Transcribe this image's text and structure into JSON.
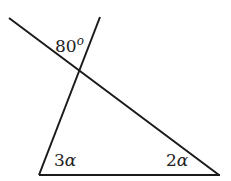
{
  "diagram": {
    "type": "geometry-triangle",
    "labels": {
      "exterior_angle": "80",
      "exterior_angle_unit": "o",
      "left_angle_coef": "3",
      "left_angle_var": "α",
      "right_angle_coef": "2",
      "right_angle_var": "α"
    },
    "lines": [
      {
        "name": "transversal",
        "x1": 9,
        "y1": 18,
        "x2": 219,
        "y2": 175
      },
      {
        "name": "left-side",
        "x1": 100,
        "y1": 17,
        "x2": 39,
        "y2": 175
      },
      {
        "name": "base",
        "x1": 39,
        "y1": 175,
        "x2": 219,
        "y2": 175
      }
    ],
    "stroke_color": "#1a1a1a"
  }
}
